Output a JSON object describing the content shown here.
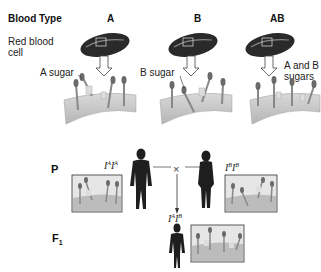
{
  "header": {
    "row_label": "Blood Type",
    "columns": [
      "A",
      "B",
      "AB"
    ]
  },
  "labels": {
    "red_blood_cell": "Red blood cell",
    "red_blood_cell_line1": "Red blood",
    "red_blood_cell_line2": "cell",
    "a_sugar": "A sugar",
    "b_sugar": "B sugar",
    "ab_sugars_line1": "A and B",
    "ab_sugars_line2": "sugars"
  },
  "cross": {
    "parental_label": "P",
    "f1_label": "F",
    "f1_sub": "1",
    "cross_symbol": "×",
    "father_genotype": {
      "base1": "I",
      "sup1": "A",
      "base2": "I",
      "sup2": "A"
    },
    "mother_genotype": {
      "base1": "I",
      "sup1": "B",
      "base2": "I",
      "sup2": "B"
    },
    "child_genotype": {
      "base1": "I",
      "sup1": "A",
      "base2": "I",
      "sup2": "B"
    }
  },
  "colors": {
    "cell": "#2a2a2a",
    "membrane": "#c9c9c9",
    "silhouette": "#1e1e1e",
    "glycoprotein": "#6a6a6a"
  }
}
